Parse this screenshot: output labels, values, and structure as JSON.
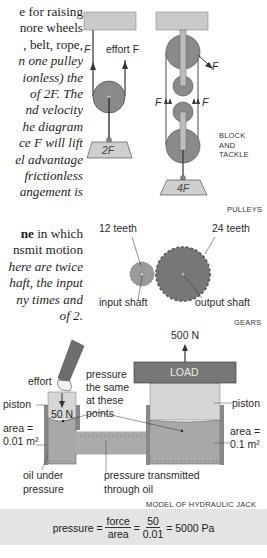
{
  "left_text": {
    "pulleys_paragraph": [
      {
        "text": "e for raising",
        "style": "normal"
      },
      {
        "text": "nore wheels",
        "style": "normal"
      },
      {
        "text": ", belt, rope,",
        "style": "normal"
      },
      {
        "text": "n one pulley",
        "style": "italic"
      },
      {
        "text": "ionless) the",
        "style": "italic"
      },
      {
        "text": "of 2F. The",
        "style": "italic"
      },
      {
        "text": "nd velocity",
        "style": "italic"
      },
      {
        "text": "he diagram",
        "style": "italic"
      },
      {
        "text": "ce F will lift",
        "style": "italic"
      },
      {
        "text": "el advantage",
        "style": "italic"
      },
      {
        "text": "frictionless",
        "style": "italic"
      },
      {
        "text": "angement is",
        "style": "italic"
      }
    ],
    "gears_paragraph": [
      {
        "bold": "ne",
        "rest": " in which"
      },
      {
        "text": "nsmit motion",
        "style": "normal"
      },
      {
        "text": "here are twice",
        "style": "italic"
      },
      {
        "text": "haft, the input",
        "style": "italic"
      },
      {
        "text": "ny times and",
        "style": "italic"
      },
      {
        "text": "of 2.",
        "style": "italic"
      }
    ]
  },
  "pulleys": {
    "single": {
      "label_F": "F",
      "label_effort": "effort F",
      "load": "2F"
    },
    "block_tackle": {
      "label_F_out": "F",
      "label_F_left": "F",
      "label_F_right": "F",
      "load": "4F",
      "caption": [
        "BLOCK",
        "AND",
        "TACKLE"
      ]
    },
    "caption": "PULLEYS"
  },
  "gears": {
    "small_teeth": "12 teeth",
    "large_teeth": "24 teeth",
    "input_label": "input shaft",
    "output_label": "output shaft",
    "caption": "GEARS"
  },
  "hydraulic": {
    "effort": "effort",
    "piston_left": "piston",
    "force_small": "50 N",
    "pressure_note": [
      "pressure",
      "the same",
      "at these",
      "points"
    ],
    "force_large": "500 N",
    "load": "LOAD",
    "piston_right": "piston",
    "area_left": [
      "area =",
      "0.01 m²"
    ],
    "area_right": [
      "area =",
      "0.1 m²"
    ],
    "oil_label": [
      "oil under",
      "pressure"
    ],
    "transmit_label": [
      "pressure transmitted",
      "through oil"
    ],
    "caption": "MODEL OF HYDRAULIC JACK"
  },
  "formula": {
    "lhs": "pressure",
    "eq": "=",
    "frac1_num": "force",
    "frac1_den": "area",
    "frac2_num": "50",
    "frac2_den": "0.01",
    "result": "5000 Pa"
  },
  "colors": {
    "dark_grey": "#7a7a7a",
    "mid_grey": "#9a9a9a",
    "light_grey": "#c8c8c8",
    "panel_grey": "#e4e4e4"
  }
}
